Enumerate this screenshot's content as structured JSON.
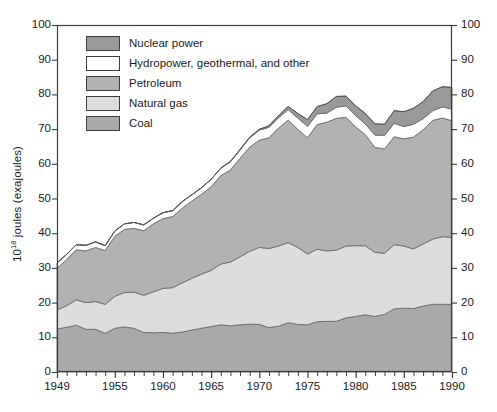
{
  "chart_data": {
    "type": "area",
    "stacked": true,
    "title": "",
    "subtitle": "",
    "xlabel": "",
    "ylabel": "10¹⁸ joules (exajoules)",
    "ylabel_base": "10",
    "ylabel_exponent": "18",
    "ylabel_rest": " joules (exajoules)",
    "xlim": [
      1949,
      1990
    ],
    "ylim": [
      0,
      100
    ],
    "grid": false,
    "legend_position": "upper-left-inside",
    "y_ticks": [
      0,
      10,
      20,
      30,
      40,
      50,
      60,
      70,
      80,
      90,
      100
    ],
    "y_tick_labels": [
      "0",
      "10",
      "20",
      "30",
      "40",
      "50",
      "60",
      "70",
      "80",
      "90",
      "100"
    ],
    "y_axis_right_ticks": [
      0,
      10,
      20,
      30,
      40,
      50,
      60,
      70,
      80,
      90,
      100
    ],
    "y_axis_right_tick_labels": [
      "0",
      "10",
      "20",
      "30",
      "40",
      "50",
      "60",
      "70",
      "80",
      "90",
      "100"
    ],
    "x_ticks_major": [
      1949,
      1955,
      1960,
      1965,
      1970,
      1975,
      1980,
      1985,
      1990
    ],
    "x_tick_labels": [
      "1949",
      "1955",
      "1960",
      "1965",
      "1970",
      "1975",
      "1980",
      "1985",
      "1990"
    ],
    "x_tick_minor_interval": 1,
    "x": [
      1949,
      1950,
      1951,
      1952,
      1953,
      1954,
      1955,
      1956,
      1957,
      1958,
      1959,
      1960,
      1961,
      1962,
      1963,
      1964,
      1965,
      1966,
      1967,
      1968,
      1969,
      1970,
      1971,
      1972,
      1973,
      1974,
      1975,
      1976,
      1977,
      1978,
      1979,
      1980,
      1981,
      1982,
      1983,
      1984,
      1985,
      1986,
      1987,
      1988,
      1989,
      1990
    ],
    "series": [
      {
        "name": "Coal",
        "color": "#a9a9a9",
        "values": [
          12.4,
          12.9,
          13.5,
          12.3,
          12.3,
          11.1,
          12.6,
          13.0,
          12.6,
          11.4,
          11.3,
          11.4,
          11.2,
          11.5,
          12.1,
          12.6,
          13.1,
          13.6,
          13.3,
          13.6,
          13.8,
          13.7,
          12.8,
          13.2,
          14.2,
          13.7,
          13.6,
          14.5,
          14.6,
          14.6,
          15.6,
          16.0,
          16.5,
          16.0,
          16.6,
          18.2,
          18.4,
          18.3,
          19.0,
          19.5,
          19.5,
          19.5
        ]
      },
      {
        "name": "Natural gas",
        "color": "#dddddd",
        "values": [
          5.5,
          6.2,
          7.3,
          7.7,
          8.0,
          8.4,
          9.2,
          9.9,
          10.4,
          10.7,
          11.8,
          12.7,
          13.1,
          14.2,
          14.9,
          15.6,
          16.2,
          17.5,
          18.4,
          19.6,
          21.0,
          22.2,
          22.8,
          23.1,
          23.1,
          22.2,
          20.4,
          20.9,
          20.3,
          20.5,
          20.7,
          20.4,
          19.9,
          18.5,
          17.6,
          18.5,
          17.9,
          17.2,
          17.9,
          18.8,
          19.5,
          19.3
        ]
      },
      {
        "name": "Petroleum",
        "color": "#b2b2b2",
        "values": [
          12.0,
          13.3,
          14.4,
          14.9,
          15.6,
          15.5,
          17.3,
          18.2,
          18.4,
          18.6,
          19.6,
          20.1,
          20.5,
          21.5,
          22.3,
          23.0,
          24.1,
          25.5,
          26.5,
          28.4,
          30.0,
          30.9,
          31.9,
          34.0,
          35.3,
          34.0,
          33.5,
          35.9,
          37.1,
          38.0,
          37.1,
          34.2,
          32.0,
          30.2,
          30.1,
          31.1,
          30.9,
          32.2,
          32.9,
          34.2,
          34.2,
          33.6
        ]
      },
      {
        "name": "Hydropower, geothermal, and other",
        "color": "#ffffff",
        "values": [
          1.5,
          1.5,
          1.5,
          1.6,
          1.6,
          1.4,
          1.5,
          1.6,
          1.7,
          1.7,
          1.6,
          1.7,
          1.7,
          1.9,
          1.8,
          1.9,
          2.1,
          2.1,
          2.4,
          2.4,
          2.7,
          2.9,
          3.0,
          3.0,
          3.0,
          3.3,
          3.3,
          3.1,
          2.6,
          3.2,
          3.3,
          3.3,
          3.1,
          3.6,
          3.9,
          3.9,
          3.5,
          3.7,
          3.2,
          2.8,
          3.2,
          3.4
        ]
      },
      {
        "name": "Nuclear power",
        "color": "#999999",
        "values": [
          0.0,
          0.0,
          0.0,
          0.0,
          0.0,
          0.0,
          0.0,
          0.0,
          0.0,
          0.0,
          0.0,
          0.0,
          0.0,
          0.0,
          0.0,
          0.0,
          0.05,
          0.07,
          0.09,
          0.14,
          0.16,
          0.24,
          0.43,
          0.61,
          0.92,
          1.3,
          1.9,
          2.1,
          2.7,
          3.1,
          2.8,
          2.8,
          3.0,
          3.2,
          3.2,
          3.6,
          4.3,
          4.6,
          4.9,
          5.7,
          5.8,
          6.2
        ]
      }
    ]
  },
  "legend": {
    "items": [
      {
        "label": "Nuclear power",
        "swatch_color": "#999999"
      },
      {
        "label": "Hydropower, geothermal, and other",
        "swatch_color": "#ffffff"
      },
      {
        "label": "Petroleum",
        "swatch_color": "#b2b2b2"
      },
      {
        "label": "Natural gas",
        "swatch_color": "#dddddd"
      },
      {
        "label": "Coal",
        "swatch_color": "#a9a9a9"
      }
    ]
  },
  "style": {
    "axis_color": "#3c3c3c",
    "text_color": "#1a1a1a",
    "background": "#ffffff",
    "line_color": "#6e6e6e"
  }
}
